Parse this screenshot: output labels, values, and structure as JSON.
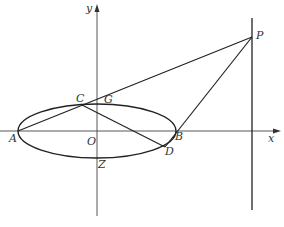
{
  "diagram": {
    "type": "coordinate-geometry",
    "colors": {
      "stroke": "#222222",
      "axis": "#444444",
      "label": "#333333",
      "background": "#ffffff"
    },
    "axes": {
      "x_label": "x",
      "y_label": "y",
      "origin_label": "O"
    },
    "points": {
      "A": {
        "label": "A",
        "x": 18,
        "y": 131
      },
      "B": {
        "label": "B",
        "x": 176,
        "y": 131
      },
      "C": {
        "label": "C",
        "x": 82,
        "y": 105
      },
      "D": {
        "label": "D",
        "x": 165,
        "y": 147
      },
      "G": {
        "label": "G",
        "x": 97,
        "y": 103
      },
      "P": {
        "label": "P",
        "x": 252,
        "y": 37
      },
      "Z": {
        "label": "Z",
        "x": 97,
        "y": 157
      },
      "O": {
        "label": "O",
        "x": 97,
        "y": 131
      }
    },
    "ellipse": {
      "cx": 97,
      "cy": 131,
      "rx": 79,
      "ry": 27
    },
    "segments": [
      {
        "from": "A",
        "to": "P",
        "via": "C"
      },
      {
        "from": "C",
        "to": "D"
      },
      {
        "from": "B",
        "to": "P"
      }
    ],
    "vertical_line": {
      "x": 252,
      "y1": 18,
      "y2": 210
    }
  }
}
